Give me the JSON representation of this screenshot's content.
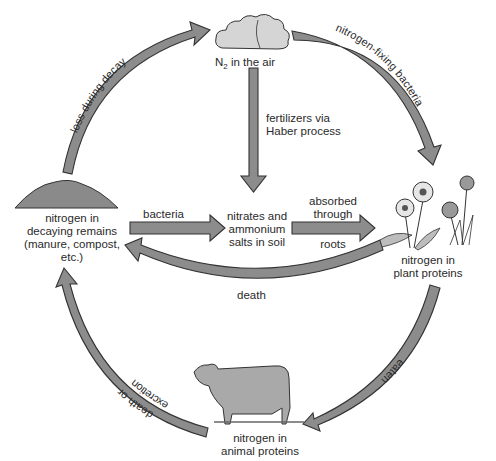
{
  "diagram": {
    "nodes": {
      "air": {
        "label_main": "N",
        "label_sub": "2",
        "label_rest": " in the air"
      },
      "decay": {
        "line1": "nitrogen in",
        "line2": "decaying remains",
        "line3": "(manure, compost,",
        "line4": "etc.)"
      },
      "soil": {
        "line1": "nitrates and",
        "line2": "ammonium",
        "line3": "salts in soil"
      },
      "plants": {
        "line1": "nitrogen in",
        "line2": "plant proteins"
      },
      "animals": {
        "line1": "nitrogen in",
        "line2": "animal proteins"
      }
    },
    "edges": {
      "loss_during_decay": "loss during decay",
      "nitrogen_fixing": "nitrogen-fixing bacteria",
      "fertilizers_line1": "fertilizers via",
      "fertilizers_line2": "Haber process",
      "bacteria": "bacteria",
      "absorbed_line1": "absorbed",
      "absorbed_line2": "through",
      "absorbed_line3": "roots",
      "death": "death",
      "eaten": "eaten",
      "death_or": "death or",
      "excretion": "excretion"
    },
    "colors": {
      "arrow_fill": "#8c8c8c",
      "arrow_stroke": "#333333",
      "illustration": "#a9a9a9"
    }
  }
}
